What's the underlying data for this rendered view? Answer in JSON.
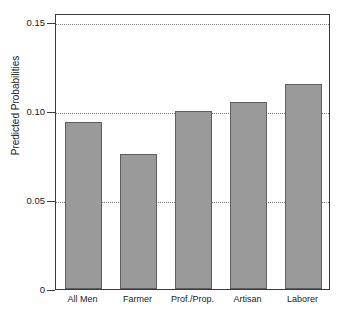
{
  "chart_data": {
    "type": "bar",
    "title": "",
    "subtitle": "",
    "xlabel": "",
    "ylabel": "Predicted Probabilities",
    "categories": [
      "All Men",
      "Farmer",
      "Prof./Prop.",
      "Artisan",
      "Laborer"
    ],
    "values": [
      0.094,
      0.076,
      0.1,
      0.105,
      0.115
    ],
    "ylim": [
      0,
      0.155
    ],
    "yticks": [
      0,
      0.05,
      0.1,
      0.15
    ],
    "ytick_labels": [
      "0",
      "0.05",
      "0.10",
      "0.15"
    ],
    "grid": "horizontal-dotted",
    "legend": "none",
    "bar_color": "#9a9a9a",
    "bar_edge_color": "#5e5e5e",
    "frame_color": "#3a3a3a",
    "gridline_color": "#7a7a7a"
  }
}
